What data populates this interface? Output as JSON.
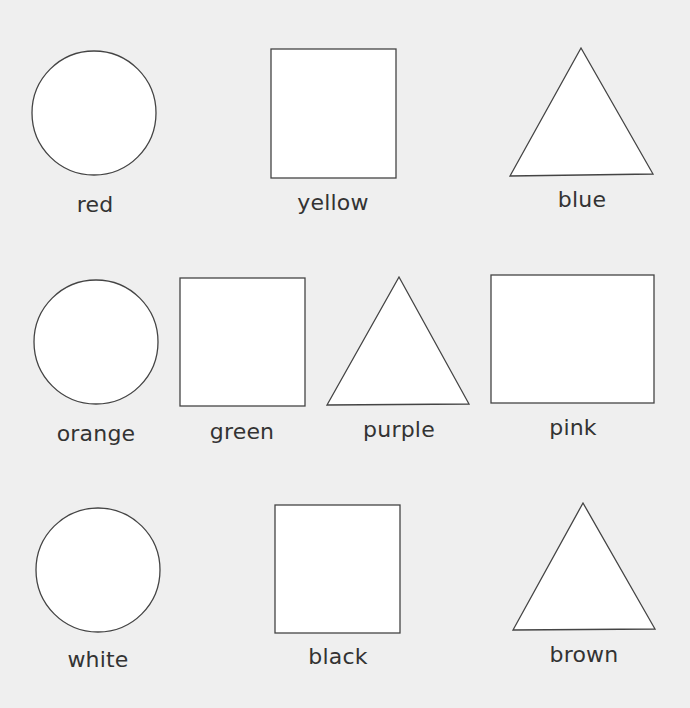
{
  "worksheet": {
    "background": "#efefef",
    "shape_fill": "#ffffff",
    "shape_stroke": "#444444",
    "text_color": "#333333",
    "rows": [
      {
        "items": [
          {
            "shape": "circle",
            "label": "red"
          },
          {
            "shape": "square",
            "label": "yellow"
          },
          {
            "shape": "triangle",
            "label": "blue"
          }
        ]
      },
      {
        "items": [
          {
            "shape": "circle",
            "label": "orange"
          },
          {
            "shape": "square",
            "label": "green"
          },
          {
            "shape": "triangle",
            "label": "purple"
          },
          {
            "shape": "rectangle",
            "label": "pink"
          }
        ]
      },
      {
        "items": [
          {
            "shape": "circle",
            "label": "white"
          },
          {
            "shape": "square",
            "label": "black"
          },
          {
            "shape": "triangle",
            "label": "brown"
          }
        ]
      }
    ]
  }
}
